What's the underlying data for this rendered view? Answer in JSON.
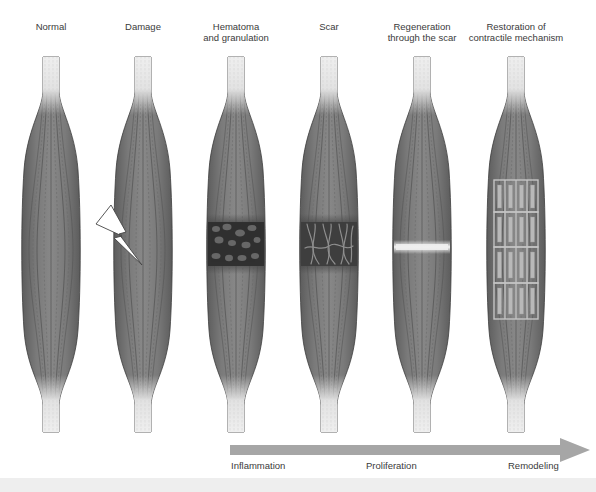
{
  "diagram": {
    "stages": [
      {
        "id": "normal",
        "label": "Normal",
        "center_x": 51
      },
      {
        "id": "damage",
        "label": "Damage",
        "center_x": 143
      },
      {
        "id": "hematoma",
        "label": "Hematoma\nand granulation",
        "center_x": 236
      },
      {
        "id": "scar",
        "label": "Scar",
        "center_x": 329
      },
      {
        "id": "regeneration",
        "label": "Regeneration\nthrough the scar",
        "center_x": 422
      },
      {
        "id": "restoration",
        "label": "Restoration of\ncontractile mechanism",
        "center_x": 516
      }
    ],
    "timeline": {
      "arrow_color": "#a6a6a6",
      "phases": [
        {
          "label": "Inflammation",
          "x": 231
        },
        {
          "label": "Proliferation",
          "x": 366
        },
        {
          "label": "Remodeling",
          "x": 508
        }
      ]
    },
    "icons": {
      "damage": "lightning-bolt-icon"
    },
    "colors": {
      "muscle_dark": "#5a5a5a",
      "muscle_mid": "#7f7f7f",
      "tendon": "#e6e6e6",
      "lesion_dark": "#2f2f2f",
      "scar_band": "#f2f2f2"
    }
  }
}
